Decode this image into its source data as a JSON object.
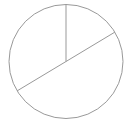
{
  "figure": {
    "title": "",
    "background_color": "#ffffff",
    "width": 132,
    "height": 131
  },
  "chart_data": {
    "type": "pie",
    "title": "",
    "subtitle": "",
    "xlabel": "",
    "ylabel": "",
    "legend": [],
    "legend_position": "none",
    "grid": false,
    "labels_shown": false,
    "stroke_color": "#999999",
    "stroke_width": 1,
    "fill_color": "none",
    "center_x": 66,
    "center_y": 61.5,
    "radius": 57,
    "start_angle_deg": 90,
    "direction": "clockwise",
    "categories": [
      "Slice 1",
      "Slice 2",
      "Slice 3"
    ],
    "values": [
      59,
      180,
      121
    ],
    "values_unit": "degrees",
    "percentages": [
      16.4,
      50.0,
      33.6
    ],
    "boundary_angles_deg": [
      90,
      31,
      -149
    ],
    "slices": [
      {
        "name": "Slice 1",
        "start_angle_deg": 90,
        "end_angle_deg": 31,
        "sweep_deg": 59,
        "percent": 16.4,
        "fill": "none",
        "stroke": "#999999"
      },
      {
        "name": "Slice 2",
        "start_angle_deg": 31,
        "end_angle_deg": -149,
        "sweep_deg": 180,
        "percent": 50.0,
        "fill": "none",
        "stroke": "#999999"
      },
      {
        "name": "Slice 3",
        "start_angle_deg": -149,
        "end_angle_deg": -270,
        "sweep_deg": 121,
        "percent": 33.6,
        "fill": "none",
        "stroke": "#999999"
      }
    ],
    "dividers": [
      {
        "name": "divider-top",
        "from": [
          66,
          61.5
        ],
        "to": [
          66,
          4.5
        ],
        "angle_deg": 90
      },
      {
        "name": "divider-upper-right",
        "from": [
          66,
          61.5
        ],
        "to": [
          114.9,
          32.1
        ],
        "angle_deg": 31
      },
      {
        "name": "divider-lower-left",
        "from": [
          66,
          61.5
        ],
        "to": [
          17.1,
          90.9
        ],
        "angle_deg": -149
      }
    ],
    "circle_outline": {
      "name": "pie-outline",
      "cx": 66,
      "cy": 61.5,
      "r": 57,
      "stroke": "#999999",
      "stroke_width": 1,
      "fill": "none"
    }
  }
}
